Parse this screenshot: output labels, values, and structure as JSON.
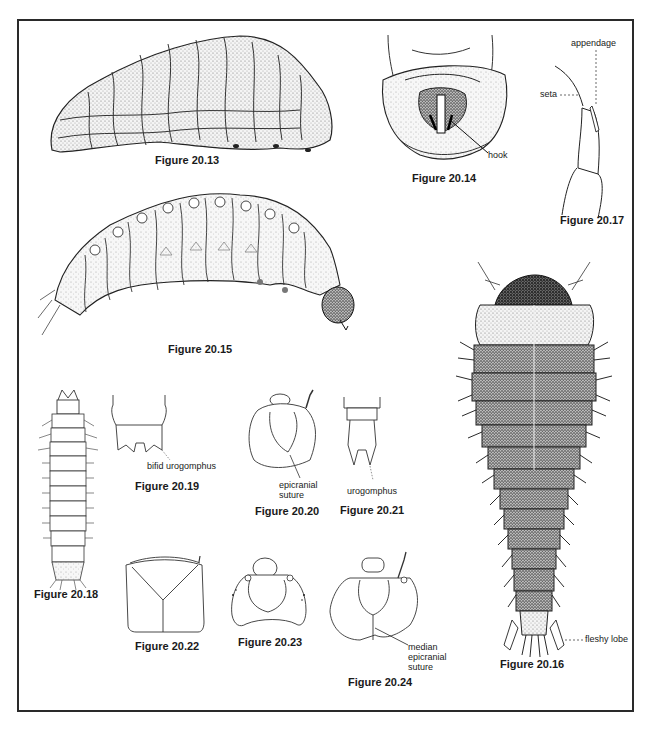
{
  "page": {
    "type": "scientific-figure-plate"
  },
  "figures": [
    {
      "id": "20.13",
      "caption": "Figure 20.13",
      "labels": []
    },
    {
      "id": "20.14",
      "caption": "Figure 20.14",
      "labels": [
        "hook"
      ]
    },
    {
      "id": "20.15",
      "caption": "Figure 20.15",
      "labels": []
    },
    {
      "id": "20.16",
      "caption": "Figure 20.16",
      "labels": [
        "fleshy lobe"
      ]
    },
    {
      "id": "20.17",
      "caption": "Figure 20.17",
      "labels": [
        "appendage",
        "seta"
      ]
    },
    {
      "id": "20.18",
      "caption": "Figure 20.18",
      "labels": []
    },
    {
      "id": "20.19",
      "caption": "Figure 20.19",
      "labels": [
        "bifid urogomphus"
      ]
    },
    {
      "id": "20.20",
      "caption": "Figure 20.20",
      "labels": [
        "epicranial",
        "suture"
      ]
    },
    {
      "id": "20.21",
      "caption": "Figure 20.21",
      "labels": [
        "urogomphus"
      ]
    },
    {
      "id": "20.22",
      "caption": "Figure 20.22",
      "labels": []
    },
    {
      "id": "20.23",
      "caption": "Figure 20.23",
      "labels": []
    },
    {
      "id": "20.24",
      "caption": "Figure 20.24",
      "labels": [
        "median",
        "epicranial",
        "suture"
      ]
    }
  ]
}
